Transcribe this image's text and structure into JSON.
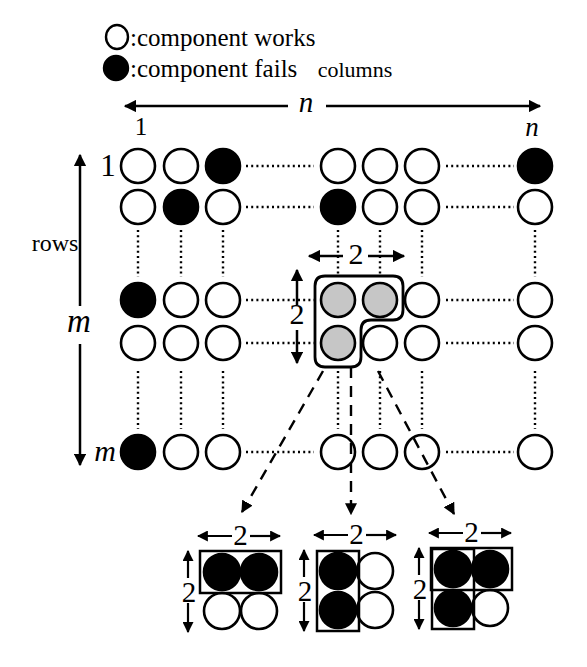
{
  "legend": {
    "works_label": ":component works",
    "fails_label": ":component fails"
  },
  "labels": {
    "columns": "columns",
    "rows": "rows",
    "col_first": "1",
    "col_count": "n",
    "row_first": "1",
    "row_count": "m",
    "window": "2"
  },
  "colors": {
    "background": "#ffffff",
    "stroke": "#000000",
    "works_fill": "#ffffff",
    "fails_fill": "#000000",
    "selected_fill": "#c6c6c6"
  },
  "grid": {
    "rows_shown": 5,
    "cols_shown": 7,
    "cells": [
      [
        "works",
        "works",
        "fails",
        "works",
        "works",
        "works",
        "fails"
      ],
      [
        "works",
        "fails",
        "works",
        "fails",
        "works",
        "works",
        "works"
      ],
      [
        "fails",
        "works",
        "works",
        "selected",
        "selected",
        "works",
        "works"
      ],
      [
        "works",
        "works",
        "works",
        "selected",
        "works",
        "works",
        "works"
      ],
      [
        "fails",
        "works",
        "works",
        "works",
        "works",
        "works",
        "works"
      ]
    ]
  },
  "mini_diagrams": [
    {
      "cells": [
        [
          "fails",
          "fails"
        ],
        [
          "works",
          "works"
        ]
      ],
      "boxes": [
        "top-row"
      ]
    },
    {
      "cells": [
        [
          "fails",
          "works"
        ],
        [
          "fails",
          "works"
        ]
      ],
      "boxes": [
        "left-col"
      ]
    },
    {
      "cells": [
        [
          "fails",
          "fails"
        ],
        [
          "fails",
          "works"
        ]
      ],
      "boxes": [
        "top-row",
        "left-col"
      ]
    }
  ]
}
